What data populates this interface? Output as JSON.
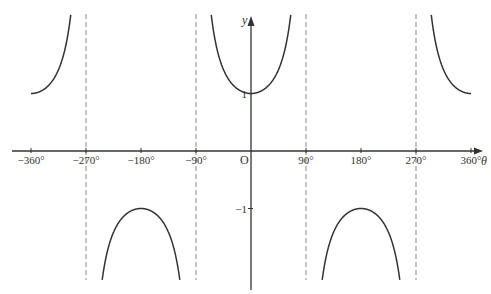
{
  "chart_data": {
    "type": "line",
    "title": "",
    "function": "y = sec(theta)",
    "xlabel": "θ",
    "ylabel": "y",
    "origin_label": "O",
    "xlim": [
      -360,
      360
    ],
    "ylim": [
      -2.5,
      2.5
    ],
    "grid": false,
    "x_ticks": [
      -360,
      -270,
      -180,
      -90,
      90,
      180,
      270,
      360
    ],
    "x_tick_labels": [
      "−360°",
      "−270°",
      "−180°",
      "−90°",
      "90°",
      "180°",
      "270°",
      "360°"
    ],
    "y_ticks": [
      1,
      -1
    ],
    "y_tick_labels": [
      "1",
      "−1"
    ],
    "asymptotes": [
      -270,
      -90,
      90,
      270
    ],
    "series": [
      {
        "name": "branch-1",
        "x_range": [
          -360,
          -270
        ],
        "values_note": "sec θ, from 1 at −360° rising to +∞"
      },
      {
        "name": "branch-2",
        "x_range": [
          -270,
          -90
        ],
        "values_note": "sec θ, maximum −1 at −180°"
      },
      {
        "name": "branch-3",
        "x_range": [
          -90,
          90
        ],
        "values_note": "sec θ, minimum 1 at 0°"
      },
      {
        "name": "branch-4",
        "x_range": [
          90,
          270
        ],
        "values_note": "sec θ, maximum −1 at 180°"
      },
      {
        "name": "branch-5",
        "x_range": [
          270,
          360
        ],
        "values_note": "sec θ, falling from +∞ to 1 at 360°"
      }
    ]
  }
}
